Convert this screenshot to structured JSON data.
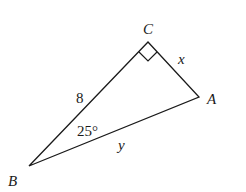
{
  "diagram": {
    "type": "right-triangle",
    "vertices": {
      "A": {
        "label": "A",
        "x": 199,
        "y": 97
      },
      "B": {
        "label": "B",
        "x": 29,
        "y": 166
      },
      "C": {
        "label": "C",
        "x": 148,
        "y": 42
      }
    },
    "sides": {
      "BC": {
        "label": "8"
      },
      "CA": {
        "label": "x"
      },
      "BA": {
        "label": "y"
      }
    },
    "angles": {
      "B": {
        "label": "25°"
      },
      "C": {
        "right_angle": true
      }
    },
    "stroke_color": "#1a1a1a"
  }
}
